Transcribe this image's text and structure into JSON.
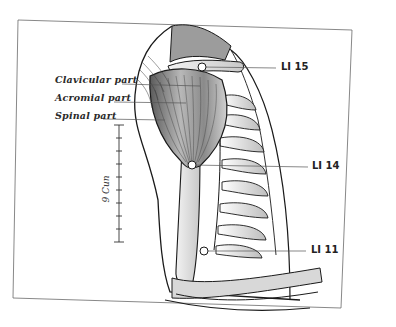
{
  "diagram": {
    "muscle_labels": [
      {
        "id": "clavicular",
        "text": "Clavicular part"
      },
      {
        "id": "acromial",
        "text": "Acromial part"
      },
      {
        "id": "spinal",
        "text": "Spinal part"
      }
    ],
    "acupoints": [
      {
        "id": "li15",
        "text": "LI 15"
      },
      {
        "id": "li14",
        "text": "LI 14"
      },
      {
        "id": "li11",
        "text": "LI 11"
      }
    ],
    "scale": {
      "text": "9 Cun",
      "ticks": 10
    },
    "colors": {
      "line": "#1a1a1a",
      "muscle_fill": "#9a9a9a",
      "bone_fill": "#e4e4e4",
      "frame": "#555555"
    }
  }
}
